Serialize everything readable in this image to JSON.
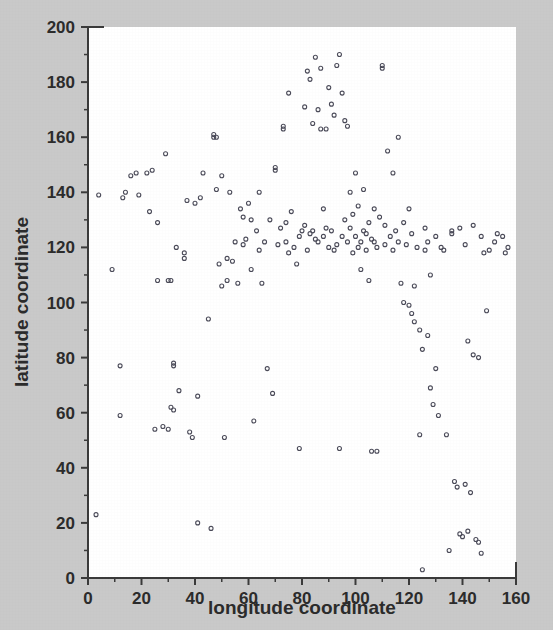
{
  "figure": {
    "background_color": "#c9c9c9",
    "plot_background_color": "#ffffff",
    "axis_color": "#3a3a3a",
    "marker_color": "#4a4a58"
  },
  "chart_data": {
    "type": "scatter",
    "title": "",
    "subtitle": "",
    "xlabel": "longitude coordinate",
    "ylabel": "latitude coordinate",
    "xlim": [
      0,
      160
    ],
    "ylim": [
      0,
      200
    ],
    "xticks": [
      0,
      20,
      40,
      60,
      80,
      100,
      120,
      140,
      160
    ],
    "yticks": [
      0,
      20,
      40,
      60,
      80,
      100,
      120,
      140,
      160,
      180,
      200
    ],
    "xtick_labels": [
      "0",
      "20",
      "40",
      "60",
      "80",
      "100",
      "120",
      "140",
      "160"
    ],
    "ytick_labels": [
      "0",
      "20",
      "40",
      "60",
      "80",
      "100",
      "120",
      "140",
      "160",
      "180",
      "200"
    ],
    "minor_ticks": true,
    "minor_tick_interval": 10,
    "grid": false,
    "legend": null,
    "marker": "open-circle",
    "marker_size": 4,
    "n_points": 203,
    "series": [
      {
        "name": "locations",
        "points": [
          [
            3,
            23
          ],
          [
            4,
            139
          ],
          [
            9,
            112
          ],
          [
            12,
            59
          ],
          [
            12,
            77
          ],
          [
            13,
            138
          ],
          [
            14,
            140
          ],
          [
            16,
            146
          ],
          [
            18,
            147
          ],
          [
            19,
            139
          ],
          [
            22,
            147
          ],
          [
            23,
            133
          ],
          [
            24,
            148
          ],
          [
            25,
            54
          ],
          [
            26,
            129
          ],
          [
            26,
            108
          ],
          [
            28,
            55
          ],
          [
            29,
            154
          ],
          [
            30,
            108
          ],
          [
            30,
            54
          ],
          [
            31,
            108
          ],
          [
            31,
            62
          ],
          [
            32,
            61
          ],
          [
            32,
            77
          ],
          [
            32,
            78
          ],
          [
            33,
            120
          ],
          [
            34,
            68
          ],
          [
            36,
            118
          ],
          [
            36,
            116
          ],
          [
            37,
            137
          ],
          [
            38,
            53
          ],
          [
            39,
            51
          ],
          [
            40,
            136
          ],
          [
            41,
            66
          ],
          [
            41,
            20
          ],
          [
            42,
            138
          ],
          [
            43,
            147
          ],
          [
            45,
            94
          ],
          [
            46,
            18
          ],
          [
            47,
            161
          ],
          [
            47,
            160
          ],
          [
            48,
            141
          ],
          [
            48,
            160
          ],
          [
            49,
            114
          ],
          [
            50,
            146
          ],
          [
            50,
            106
          ],
          [
            51,
            51
          ],
          [
            52,
            116
          ],
          [
            52,
            108
          ],
          [
            53,
            140
          ],
          [
            54,
            115
          ],
          [
            55,
            122
          ],
          [
            56,
            107
          ],
          [
            57,
            134
          ],
          [
            58,
            131
          ],
          [
            58,
            121
          ],
          [
            59,
            123
          ],
          [
            60,
            136
          ],
          [
            61,
            130
          ],
          [
            61,
            112
          ],
          [
            62,
            57
          ],
          [
            63,
            126
          ],
          [
            64,
            119
          ],
          [
            64,
            140
          ],
          [
            65,
            107
          ],
          [
            66,
            122
          ],
          [
            67,
            76
          ],
          [
            68,
            130
          ],
          [
            69,
            67
          ],
          [
            70,
            148
          ],
          [
            70,
            149
          ],
          [
            71,
            121
          ],
          [
            72,
            127
          ],
          [
            73,
            164
          ],
          [
            73,
            163
          ],
          [
            74,
            129
          ],
          [
            74,
            122
          ],
          [
            75,
            176
          ],
          [
            75,
            118
          ],
          [
            76,
            133
          ],
          [
            77,
            120
          ],
          [
            78,
            114
          ],
          [
            79,
            124
          ],
          [
            79,
            47
          ],
          [
            80,
            126
          ],
          [
            81,
            171
          ],
          [
            81,
            128
          ],
          [
            82,
            184
          ],
          [
            82,
            119
          ],
          [
            83,
            181
          ],
          [
            83,
            125
          ],
          [
            84,
            165
          ],
          [
            84,
            126
          ],
          [
            85,
            189
          ],
          [
            85,
            123
          ],
          [
            86,
            170
          ],
          [
            86,
            122
          ],
          [
            87,
            185
          ],
          [
            87,
            163
          ],
          [
            88,
            124
          ],
          [
            88,
            134
          ],
          [
            89,
            163
          ],
          [
            89,
            127
          ],
          [
            90,
            178
          ],
          [
            90,
            120
          ],
          [
            91,
            172
          ],
          [
            91,
            126
          ],
          [
            92,
            168
          ],
          [
            92,
            119
          ],
          [
            93,
            186
          ],
          [
            93,
            121
          ],
          [
            94,
            190
          ],
          [
            94,
            47
          ],
          [
            95,
            176
          ],
          [
            95,
            124
          ],
          [
            96,
            166
          ],
          [
            96,
            130
          ],
          [
            97,
            164
          ],
          [
            97,
            122
          ],
          [
            98,
            127
          ],
          [
            98,
            140
          ],
          [
            99,
            132
          ],
          [
            99,
            118
          ],
          [
            100,
            147
          ],
          [
            100,
            124
          ],
          [
            101,
            120
          ],
          [
            101,
            135
          ],
          [
            102,
            122
          ],
          [
            102,
            112
          ],
          [
            103,
            141
          ],
          [
            103,
            126
          ],
          [
            104,
            125
          ],
          [
            104,
            119
          ],
          [
            105,
            108
          ],
          [
            105,
            129
          ],
          [
            106,
            46
          ],
          [
            106,
            123
          ],
          [
            107,
            122
          ],
          [
            107,
            134
          ],
          [
            108,
            46
          ],
          [
            108,
            120
          ],
          [
            109,
            131
          ],
          [
            110,
            186
          ],
          [
            110,
            185
          ],
          [
            111,
            128
          ],
          [
            111,
            121
          ],
          [
            112,
            155
          ],
          [
            113,
            124
          ],
          [
            114,
            147
          ],
          [
            114,
            119
          ],
          [
            115,
            126
          ],
          [
            116,
            160
          ],
          [
            116,
            122
          ],
          [
            117,
            107
          ],
          [
            118,
            129
          ],
          [
            118,
            100
          ],
          [
            119,
            121
          ],
          [
            120,
            134
          ],
          [
            120,
            99
          ],
          [
            121,
            96
          ],
          [
            121,
            125
          ],
          [
            122,
            93
          ],
          [
            122,
            106
          ],
          [
            123,
            120
          ],
          [
            124,
            90
          ],
          [
            124,
            52
          ],
          [
            125,
            83
          ],
          [
            125,
            3
          ],
          [
            126,
            119
          ],
          [
            126,
            127
          ],
          [
            127,
            88
          ],
          [
            127,
            122
          ],
          [
            128,
            69
          ],
          [
            128,
            110
          ],
          [
            129,
            63
          ],
          [
            130,
            76
          ],
          [
            130,
            124
          ],
          [
            131,
            59
          ],
          [
            132,
            120
          ],
          [
            133,
            119
          ],
          [
            134,
            52
          ],
          [
            135,
            10
          ],
          [
            136,
            126
          ],
          [
            136,
            125
          ],
          [
            137,
            35
          ],
          [
            138,
            33
          ],
          [
            139,
            127
          ],
          [
            139,
            16
          ],
          [
            140,
            15
          ],
          [
            141,
            121
          ],
          [
            141,
            34
          ],
          [
            142,
            86
          ],
          [
            142,
            17
          ],
          [
            143,
            31
          ],
          [
            144,
            81
          ],
          [
            144,
            128
          ],
          [
            145,
            14
          ],
          [
            146,
            80
          ],
          [
            146,
            13
          ],
          [
            147,
            124
          ],
          [
            147,
            9
          ],
          [
            148,
            118
          ],
          [
            149,
            97
          ],
          [
            150,
            119
          ],
          [
            152,
            122
          ],
          [
            153,
            125
          ],
          [
            155,
            124
          ],
          [
            156,
            118
          ],
          [
            157,
            120
          ]
        ]
      }
    ]
  }
}
